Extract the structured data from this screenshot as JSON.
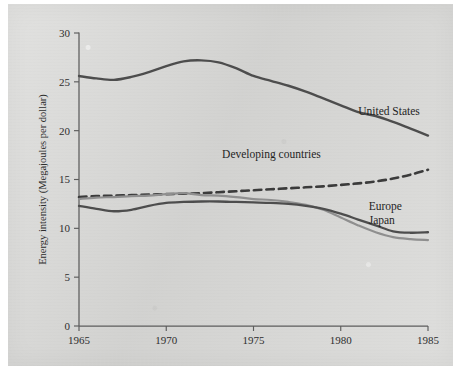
{
  "figure": {
    "background_color": "#d9d9d7",
    "page_color": "#ffffff",
    "ink_color": "#4a4a4a"
  },
  "chart_data": {
    "type": "line",
    "title": "",
    "xlabel": "",
    "ylabel": "Energy intensity (Megajoules per dollar)",
    "xlim": [
      1965,
      1985
    ],
    "ylim": [
      0,
      30
    ],
    "xticks": [
      1965,
      1970,
      1975,
      1980,
      1985
    ],
    "xtick_labels": [
      "1965",
      "1970",
      "1975",
      "1980",
      "1985"
    ],
    "yticks": [
      0,
      5,
      10,
      15,
      20,
      25,
      30
    ],
    "ytick_labels": [
      "0",
      "5",
      "10",
      "15",
      "20",
      "25",
      "30"
    ],
    "grid": false,
    "legend": "inline-annotations",
    "x": [
      1965,
      1966,
      1967,
      1968,
      1969,
      1970,
      1971,
      1972,
      1973,
      1974,
      1975,
      1976,
      1977,
      1978,
      1979,
      1980,
      1981,
      1982,
      1983,
      1984,
      1985
    ],
    "series": [
      {
        "name": "United States",
        "label": "United States",
        "color": "#4e4e4e",
        "style": "solid",
        "width": 2.4,
        "label_x": 1981.0,
        "label_y": 21.6,
        "values": [
          25.6,
          25.35,
          25.2,
          25.5,
          26.0,
          26.6,
          27.1,
          27.2,
          27.0,
          26.4,
          25.6,
          25.1,
          24.6,
          24.0,
          23.3,
          22.6,
          21.9,
          21.5,
          20.9,
          20.2,
          19.5
        ]
      },
      {
        "name": "Developing countries",
        "label": "Developing countries",
        "color": "#3a3a3a",
        "style": "dashed",
        "width": 2.6,
        "label_x": 1973.2,
        "label_y": 17.2,
        "values": [
          13.2,
          13.3,
          13.35,
          13.4,
          13.45,
          13.5,
          13.55,
          13.6,
          13.7,
          13.8,
          13.9,
          14.0,
          14.1,
          14.2,
          14.3,
          14.45,
          14.6,
          14.8,
          15.1,
          15.5,
          16.0
        ]
      },
      {
        "name": "Japan",
        "label": "Japan",
        "color": "#8f8f8f",
        "style": "solid",
        "width": 2.2,
        "label_x": 1981.6,
        "label_y": 10.4,
        "values": [
          13.0,
          13.15,
          13.2,
          13.3,
          13.35,
          13.5,
          13.6,
          13.4,
          13.35,
          13.2,
          13.0,
          12.9,
          12.7,
          12.4,
          11.9,
          11.1,
          10.3,
          9.6,
          9.1,
          8.9,
          8.8
        ]
      },
      {
        "name": "Europe",
        "label": "Europe",
        "color": "#4e4e4e",
        "style": "solid",
        "width": 2.3,
        "label_x": 1981.6,
        "label_y": 11.9,
        "values": [
          12.3,
          12.0,
          11.75,
          11.9,
          12.3,
          12.6,
          12.7,
          12.75,
          12.75,
          12.7,
          12.65,
          12.6,
          12.5,
          12.3,
          12.0,
          11.5,
          10.9,
          10.3,
          9.7,
          9.55,
          9.6
        ]
      }
    ]
  }
}
